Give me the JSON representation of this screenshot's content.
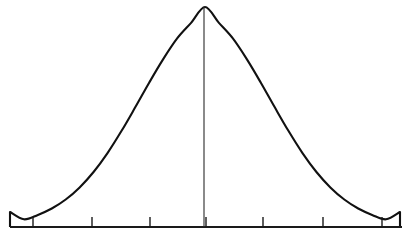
{
  "figure": {
    "background_color": "#ffffff",
    "width": 412,
    "height": 241
  },
  "style": {
    "curve_color": "#111111",
    "curve_width": 2.1,
    "axis_color": "#1a1a1a",
    "axis_width": 1.8,
    "tick_color": "#1a1a1a",
    "tick_width": 1.4,
    "center_line_color": "#2a2a2a",
    "center_line_width": 1.1
  },
  "geometry": {
    "baseline_y": 227,
    "axis_x_start": 10,
    "axis_x_end": 402,
    "peak_x": 204,
    "peak_y": 7,
    "tick_length": 10,
    "tick_positions": [
      33,
      92,
      150,
      206,
      263,
      323,
      382
    ],
    "curve_left_foot_x": 10,
    "curve_right_foot_x": 400,
    "curve_foot_top_y": 212
  },
  "chart_data": {
    "type": "line",
    "subtitle": "",
    "xlabel": "",
    "ylabel": "",
    "grid": false,
    "legend": null,
    "annotations": [],
    "distribution": "normal",
    "mean": 0,
    "std_dev": 1,
    "xlim": [
      -3.5,
      3.5
    ],
    "ylim": [
      0,
      1
    ],
    "axis_tick_values": [
      -3,
      -2,
      -1,
      0,
      1,
      2,
      3
    ],
    "axis_tick_labels": [
      "",
      "",
      "",
      "",
      "",
      "",
      ""
    ],
    "center_line_value": 0,
    "series": [
      {
        "name": "normal density",
        "x": [
          -3.5,
          -3.25,
          -3.0,
          -2.75,
          -2.5,
          -2.25,
          -2.0,
          -1.75,
          -1.5,
          -1.25,
          -1.0,
          -0.75,
          -0.5,
          -0.25,
          0.0,
          0.25,
          0.5,
          0.75,
          1.0,
          1.25,
          1.5,
          1.75,
          2.0,
          2.25,
          2.5,
          2.75,
          3.0,
          3.25,
          3.5
        ],
        "y": [
          0.022,
          0.035,
          0.055,
          0.084,
          0.125,
          0.18,
          0.25,
          0.336,
          0.436,
          0.545,
          0.657,
          0.763,
          0.857,
          0.928,
          1.0,
          0.928,
          0.857,
          0.763,
          0.657,
          0.545,
          0.436,
          0.336,
          0.25,
          0.18,
          0.125,
          0.084,
          0.055,
          0.035,
          0.022
        ]
      }
    ]
  }
}
